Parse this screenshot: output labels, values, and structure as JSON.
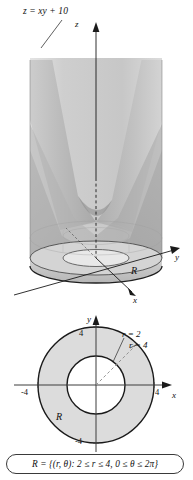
{
  "figure": {
    "title_label": "z = xy + 10",
    "surface_equation": "z = xy + 10",
    "background_color": "#ffffff",
    "ink_color": "#111111"
  },
  "plot3d": {
    "axes": {
      "z_label": "z",
      "y_label": "y",
      "x_label": "x"
    },
    "region_label": "R",
    "surface_name": "hyperbolic-paraboloid",
    "shading": {
      "light_gray": "#d7d7d7",
      "mid_gray": "#b9b9b9",
      "dark_gray": "#9d9d9d",
      "cylinder_wall": "#cfcfcf",
      "base_ring": "#c6c6c6"
    }
  },
  "plot2d": {
    "axes": {
      "y_label": "y",
      "x_label": "x"
    },
    "ticks": {
      "y_positive": "4",
      "y_negative": "-4",
      "x_positive": "4",
      "x_negative": "-4"
    },
    "radius_labels": {
      "inner": "r = 2",
      "outer": "r = 4"
    },
    "region_label": "R",
    "inner_radius": 2,
    "outer_radius": 4,
    "annulus_fill": "#dcdcdc",
    "hole_fill": "#ffffff"
  },
  "caption": {
    "set_notation": "R = {(r, θ): 2 ≤ r ≤ 4, 0 ≤ θ ≤ 2π}"
  }
}
